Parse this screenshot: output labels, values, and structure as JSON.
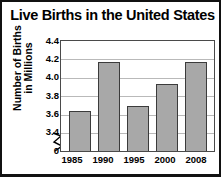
{
  "chart_data": {
    "type": "bar",
    "title": "Live Births in the United States",
    "xlabel": "",
    "ylabel": "Number of Births in Millions",
    "ylabel_line1": "Number of Births",
    "ylabel_line2": "in Millions",
    "categories": [
      "1985",
      "1990",
      "1995",
      "2000",
      "2008"
    ],
    "values": [
      3.76,
      4.21,
      3.81,
      4.01,
      4.21
    ],
    "ylim": [
      3.4,
      4.4
    ],
    "axis_break": true,
    "axis_break_label": "0",
    "ytick_labels": [
      "4.4",
      "4.2",
      "4.0",
      "3.8",
      "3.6",
      "3.4",
      "0"
    ],
    "ytick_values": [
      4.4,
      4.2,
      4.0,
      3.8,
      3.6,
      3.4,
      0
    ],
    "grid": true,
    "legend": null,
    "bar_color": "#a8a8a8",
    "bar_border_color": "#3b3b3b",
    "grid_color": "#b9b9b9",
    "frame_color": "#111111",
    "text_color": "#000000",
    "background": "#ffffff"
  }
}
